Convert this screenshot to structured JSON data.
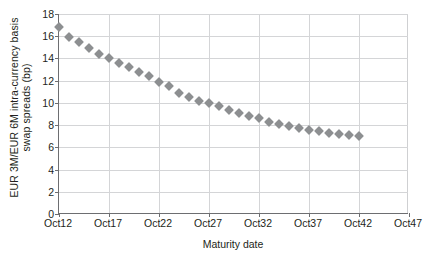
{
  "chart_data": {
    "type": "scatter",
    "title": "",
    "xlabel": "Maturity date",
    "ylabel_line1": "EUR 3M/EUR 6M intra-currency basis",
    "ylabel_line2": "swap spreads (bp)",
    "ylabel": "EUR 3M/EUR 6M intra-currency basis swap spreads (bp)",
    "xlim": [
      2012,
      2047
    ],
    "ylim": [
      0,
      18
    ],
    "grid": true,
    "legend": "none",
    "marker_shape": "diamond",
    "marker_color": "#8d8f91",
    "gridline_color": "#d4d5d7",
    "axis_color": "#6d6e71",
    "xticks": [
      2012,
      2017,
      2022,
      2027,
      2032,
      2037,
      2042,
      2047
    ],
    "xtick_labels": [
      "Oct12",
      "Oct17",
      "Oct22",
      "Oct27",
      "Oct32",
      "Oct37",
      "Oct42",
      "Oct47"
    ],
    "yticks": [
      0,
      2,
      4,
      6,
      8,
      10,
      12,
      14,
      16,
      18
    ],
    "ytick_labels": [
      "0",
      "2",
      "4",
      "6",
      "8",
      "10",
      "12",
      "14",
      "16",
      "18"
    ],
    "series": [
      {
        "name": "EUR 3M/EUR 6M basis swap spread",
        "x": [
          2012,
          2013,
          2014,
          2015,
          2016,
          2017,
          2018,
          2019,
          2020,
          2021,
          2022,
          2023,
          2024,
          2025,
          2026,
          2027,
          2028,
          2029,
          2030,
          2031,
          2032,
          2033,
          2034,
          2035,
          2036,
          2037,
          2038,
          2039,
          2040,
          2041,
          2042
        ],
        "values": [
          16.8,
          15.9,
          15.5,
          14.9,
          14.4,
          14.0,
          13.6,
          13.2,
          12.8,
          12.4,
          11.9,
          11.5,
          10.9,
          10.5,
          10.2,
          10.0,
          9.7,
          9.4,
          9.1,
          8.8,
          8.6,
          8.3,
          8.1,
          7.9,
          7.7,
          7.6,
          7.5,
          7.3,
          7.2,
          7.1,
          7.0
        ]
      }
    ]
  }
}
